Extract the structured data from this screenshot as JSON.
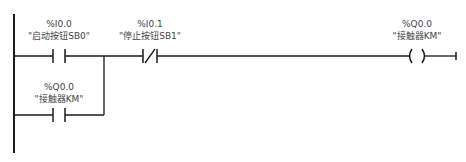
{
  "diagram": {
    "type": "ladder-logic",
    "rung": {
      "elements": [
        {
          "id": "start",
          "kind": "normally-open-contact",
          "address": "%I0.0",
          "tag": "\"启动按钮SB0\""
        },
        {
          "id": "stop",
          "kind": "normally-closed-contact",
          "address": "%I0.1",
          "tag": "\"停止按钮SB1\""
        },
        {
          "id": "coil",
          "kind": "output-coil",
          "address": "%Q0.0",
          "tag": "\"接触器KM\""
        },
        {
          "id": "seal",
          "kind": "normally-open-contact",
          "address": "%Q0.0",
          "tag": "\"接触器KM\"",
          "parallel_to": "start"
        }
      ]
    },
    "colors": {
      "line": "#1a1a1a",
      "text": "#444444",
      "background": "#ffffff"
    }
  }
}
